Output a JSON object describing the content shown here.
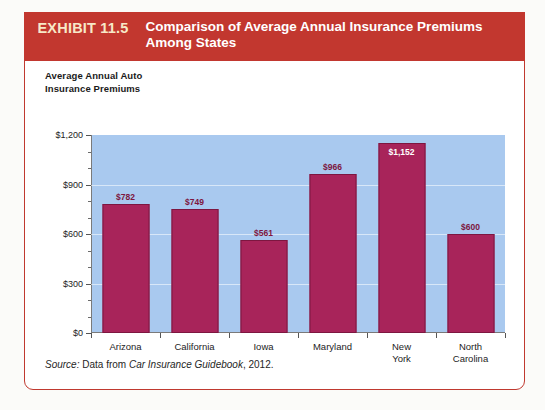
{
  "exhibit": {
    "number": "EXHIBIT 11.5",
    "title": "Comparison of Average Annual Insurance Premiums Among States"
  },
  "source": {
    "prefix": "Source:",
    "text": " Data from ",
    "work": "Car Insurance Guidebook",
    "suffix": ", 2012."
  },
  "colors": {
    "header_red": "#C2372F",
    "exhibit_number": "#F7E9C8",
    "bar_fill": "#A8245A",
    "bar_stroke": "#7D1640",
    "plot_background": "#A9C9EF",
    "border": "#C0392F"
  },
  "chart_data": {
    "type": "bar",
    "title": "Comparison of Average Annual Insurance Premiums Among States",
    "xlabel": "",
    "ylabel": "Average Annual Auto Insurance Premiums",
    "ylim": [
      0,
      1200
    ],
    "grid": true,
    "legend": "none",
    "categories": [
      "Arizona",
      "California",
      "Iowa",
      "Maryland",
      "New York",
      "North Carolina"
    ],
    "values": [
      782,
      749,
      561,
      966,
      1152,
      600
    ],
    "value_labels": [
      "$782",
      "$749",
      "$561",
      "$966",
      "$1,152",
      "$600"
    ],
    "ytick_values": [
      0,
      300,
      600,
      900,
      1200
    ],
    "ytick_labels": [
      "$0",
      "$300",
      "$600",
      "$900",
      "$1,200"
    ],
    "yminor_ticks": [
      100,
      200,
      400,
      500,
      700,
      800,
      1000,
      1100
    ]
  }
}
